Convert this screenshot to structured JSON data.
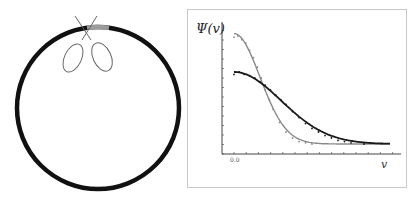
{
  "figure": {
    "left_panel": {
      "description": "ring with scissors cutting at top",
      "ring_color": "#111111",
      "cut_segment_color": "#9a9a9a",
      "scissors_color": "#666666"
    },
    "right_panel": {
      "ylabel": "Ψ(v)",
      "xlabel": "v",
      "x_tick_label": "0.0"
    }
  },
  "chart_data": {
    "type": "line",
    "title": "",
    "xlabel": "v",
    "ylabel": "Ψ(v)",
    "x_tick_labels": [
      "0.0"
    ],
    "xlim": [
      0,
      12
    ],
    "ylim": [
      0,
      1
    ],
    "grid": false,
    "legend": "none",
    "series": [
      {
        "name": "narrow",
        "color": "#8a8a8a",
        "curve": {
          "amplitude": 0.92,
          "sigma": 2.0
        },
        "points_x": [
          0,
          0.3,
          0.6,
          0.9,
          1.2,
          1.5,
          1.8,
          2.1,
          2.4,
          2.7,
          3.0,
          3.5,
          4.0,
          4.5,
          5.0,
          5.5,
          6.0
        ],
        "points_y": [
          0.89,
          0.9,
          0.87,
          0.84,
          0.78,
          0.72,
          0.64,
          0.55,
          0.45,
          0.37,
          0.29,
          0.18,
          0.1,
          0.05,
          0.02,
          0.01,
          0.0
        ]
      },
      {
        "name": "wide",
        "color": "#1a1a1a",
        "curve": {
          "amplitude": 0.6,
          "sigma": 3.6
        },
        "points_x": [
          0,
          0.4,
          0.8,
          1.2,
          1.6,
          2.0,
          2.4,
          2.8,
          3.2,
          3.6,
          4.0,
          4.5,
          5.0,
          5.5,
          6.0,
          6.5,
          7.0,
          7.5,
          8.0,
          8.5,
          9.0,
          10.0
        ],
        "points_y": [
          0.58,
          0.6,
          0.58,
          0.57,
          0.55,
          0.52,
          0.49,
          0.45,
          0.41,
          0.37,
          0.33,
          0.27,
          0.22,
          0.17,
          0.13,
          0.1,
          0.07,
          0.05,
          0.03,
          0.02,
          0.01,
          0.0
        ]
      }
    ]
  }
}
